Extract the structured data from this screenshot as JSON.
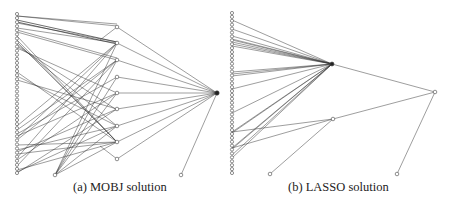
{
  "figure": {
    "panels": [
      {
        "id": "a",
        "caption": "(a) MOBJ solution",
        "input_column": {
          "x": 17,
          "y_start": 14,
          "y_end": 173,
          "count": 40
        },
        "hidden_nodes": [
          {
            "x": 117,
            "y": 27
          },
          {
            "x": 117,
            "y": 43
          },
          {
            "x": 117,
            "y": 60
          },
          {
            "x": 117,
            "y": 77
          },
          {
            "x": 117,
            "y": 93
          },
          {
            "x": 117,
            "y": 109
          },
          {
            "x": 117,
            "y": 126
          },
          {
            "x": 117,
            "y": 142
          },
          {
            "x": 117,
            "y": 159
          }
        ],
        "extra_nodes": [
          {
            "x": 55,
            "y": 175
          },
          {
            "x": 181,
            "y": 175
          }
        ],
        "output_node": {
          "x": 217,
          "y": 93
        },
        "input_edges": [
          [
            16,
            24,
            2
          ],
          [
            16,
            26,
            1
          ],
          [
            20,
            42,
            3
          ],
          [
            22,
            44,
            3
          ],
          [
            23,
            42,
            2
          ],
          [
            28,
            43,
            2
          ],
          [
            30,
            58,
            1
          ],
          [
            32,
            60,
            1
          ],
          [
            36,
            142,
            2
          ],
          [
            40,
            142,
            2
          ],
          [
            42,
            142,
            2
          ],
          [
            44,
            126,
            2
          ],
          [
            46,
            110,
            2
          ],
          [
            48,
            93,
            2
          ],
          [
            72,
            142,
            2
          ],
          [
            76,
            126,
            2
          ],
          [
            80,
            109,
            2
          ],
          [
            126,
            43,
            2
          ],
          [
            130,
            60,
            2
          ],
          [
            134,
            77,
            2
          ],
          [
            136,
            93,
            2
          ],
          [
            138,
            43,
            2
          ],
          [
            140,
            60,
            2
          ],
          [
            145,
            142,
            2
          ],
          [
            150,
            126,
            2
          ],
          [
            152,
            109,
            2
          ],
          [
            154,
            142,
            2
          ],
          [
            158,
            43,
            2
          ],
          [
            160,
            93,
            2
          ],
          [
            166,
            60,
            2
          ],
          [
            170,
            142,
            2
          ],
          [
            172,
            126,
            2
          ],
          [
            173,
            109,
            2
          ]
        ],
        "extra_edges": [
          [
            55,
            175,
            117,
            43
          ],
          [
            55,
            175,
            117,
            60
          ],
          [
            55,
            175,
            117,
            77
          ],
          [
            55,
            175,
            117,
            93
          ],
          [
            55,
            175,
            117,
            126
          ],
          [
            55,
            175,
            117,
            142
          ]
        ]
      },
      {
        "id": "b",
        "caption": "(b) LASSO solution",
        "input_column": {
          "x": 232,
          "y_start": 13,
          "y_end": 173,
          "count": 42
        },
        "hub_node": {
          "x": 332,
          "y": 64
        },
        "mid_node": {
          "x": 333,
          "y": 119
        },
        "output_node": {
          "x": 435,
          "y": 92
        },
        "bottom_nodes": [
          {
            "x": 270,
            "y": 174
          },
          {
            "x": 397,
            "y": 174
          }
        ],
        "hub_edges_from_y": [
          20,
          29,
          36,
          39,
          40,
          42,
          44,
          46,
          72,
          74,
          76,
          89,
          113,
          132,
          133,
          148,
          149,
          155,
          158
        ],
        "mid_edges_from_y": [
          132,
          148
        ]
      }
    ]
  }
}
